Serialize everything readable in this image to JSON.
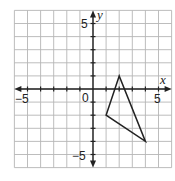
{
  "chart_data": {
    "type": "coordinate-grid",
    "title": "",
    "xlabel": "x",
    "ylabel": "y",
    "xlim": [
      -6,
      6
    ],
    "ylim": [
      -6,
      6
    ],
    "grid": true,
    "tick_labels": {
      "x": [
        {
          "value": -5,
          "label": "−5"
        },
        {
          "value": 0,
          "label": "0"
        },
        {
          "value": 5,
          "label": "5"
        }
      ],
      "y": [
        {
          "value": 5,
          "label": "5"
        },
        {
          "value": -5,
          "label": "−5"
        }
      ]
    },
    "shapes": [
      {
        "type": "triangle",
        "vertices": [
          [
            2,
            1
          ],
          [
            1,
            -2
          ],
          [
            4,
            -4
          ]
        ],
        "stroke": "#222222",
        "fill": "none"
      }
    ]
  },
  "labels": {
    "x_axis": "x",
    "y_axis": "y",
    "origin": "0",
    "x_neg5": "−5",
    "x_pos5": "5",
    "y_pos5": "5",
    "y_neg5": "−5"
  },
  "colors": {
    "grid": "#b5b5b5",
    "axis": "#222222",
    "shape": "#222222"
  }
}
